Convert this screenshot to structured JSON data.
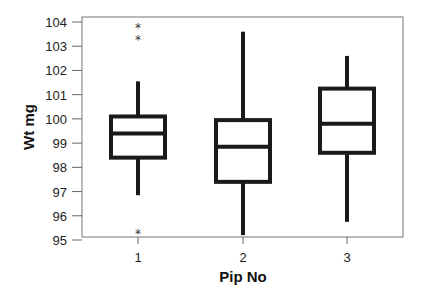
{
  "chart_data": {
    "type": "boxplot",
    "title": "",
    "xlabel": "Pip No",
    "ylabel": "Wt mg",
    "categories": [
      "1",
      "2",
      "3"
    ],
    "ylim": [
      94.8,
      104.2
    ],
    "yticks": [
      95,
      96,
      97,
      98,
      99,
      100,
      101,
      102,
      103,
      104
    ],
    "grid": false,
    "legend": null,
    "boxes": [
      {
        "category": "1",
        "whisker_low": 96.85,
        "q1": 98.4,
        "median": 99.4,
        "q3": 100.1,
        "whisker_high": 101.55,
        "outliers": [
          95.3,
          103.3,
          103.8
        ]
      },
      {
        "category": "2",
        "whisker_low": 95.2,
        "q1": 97.4,
        "median": 98.85,
        "q3": 99.95,
        "whisker_high": 103.6,
        "outliers": []
      },
      {
        "category": "3",
        "whisker_low": 95.75,
        "q1": 98.6,
        "median": 99.8,
        "q3": 101.25,
        "whisker_high": 102.6,
        "outliers": []
      }
    ],
    "colors": {
      "box_stroke": "#1a1a1a",
      "frame": "#777777",
      "background": "#ffffff"
    }
  }
}
